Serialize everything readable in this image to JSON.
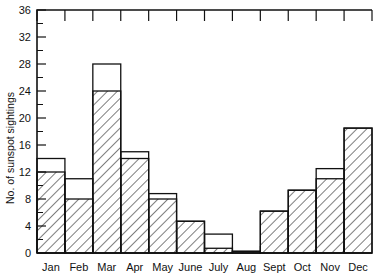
{
  "chart_data": {
    "type": "bar",
    "title": "",
    "xlabel": "",
    "ylabel": "No. of sunspot sightings",
    "categories": [
      "Jan",
      "Feb",
      "Mar",
      "Apr",
      "May",
      "June",
      "July",
      "Aug",
      "Sept",
      "Oct",
      "Nov",
      "Dec"
    ],
    "ylim": [
      0,
      36
    ],
    "xlim": [
      0,
      12
    ],
    "y_tick_labels": [
      "0",
      "4",
      "8",
      "12",
      "16",
      "20",
      "24",
      "28",
      "32",
      "36"
    ],
    "y_ticks_major": [
      0,
      4,
      8,
      12,
      16,
      20,
      24,
      28,
      32,
      36
    ],
    "y_ticks_minor": [
      2,
      6,
      10,
      14,
      18,
      22,
      26,
      30,
      34
    ],
    "grid": false,
    "legend": "none",
    "series": [
      {
        "name": "total-outline",
        "style": "outline",
        "values": [
          14,
          11,
          28,
          15,
          8.8,
          4.7,
          2.8,
          0.25,
          6.2,
          9.3,
          12.5,
          18.5
        ]
      },
      {
        "name": "hatched",
        "style": "hatched",
        "values": [
          12,
          8,
          24,
          14,
          8,
          4.7,
          0.7,
          0.25,
          6.2,
          9.3,
          11,
          18.5
        ]
      }
    ],
    "axis_style": {
      "top_axis": true,
      "right_axis": false,
      "tick_direction": "in"
    }
  }
}
